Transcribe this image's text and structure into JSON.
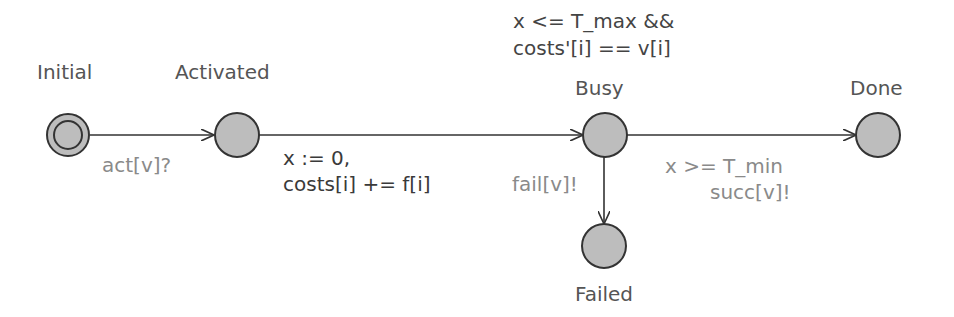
{
  "diagram": {
    "type": "timed-automaton",
    "locations": [
      {
        "id": "initial",
        "name": "Initial",
        "initial": true
      },
      {
        "id": "activated",
        "name": "Activated"
      },
      {
        "id": "busy",
        "name": "Busy",
        "invariant": [
          "x <= T_max &&",
          "costs'[i] == v[i]"
        ]
      },
      {
        "id": "done",
        "name": "Done"
      },
      {
        "id": "failed",
        "name": "Failed"
      }
    ],
    "edges": [
      {
        "from": "initial",
        "to": "activated",
        "sync": "act[v]?"
      },
      {
        "from": "activated",
        "to": "busy",
        "update": [
          "x := 0,",
          "costs[i] += f[i]"
        ]
      },
      {
        "from": "busy",
        "to": "done",
        "guard": "x >= T_min",
        "sync": "succ[v]!"
      },
      {
        "from": "busy",
        "to": "failed",
        "sync": "fail[v]!"
      }
    ]
  },
  "colors": {
    "node_fill": "#bdbdbd",
    "node_stroke": "#333333",
    "edge": "#333333"
  }
}
